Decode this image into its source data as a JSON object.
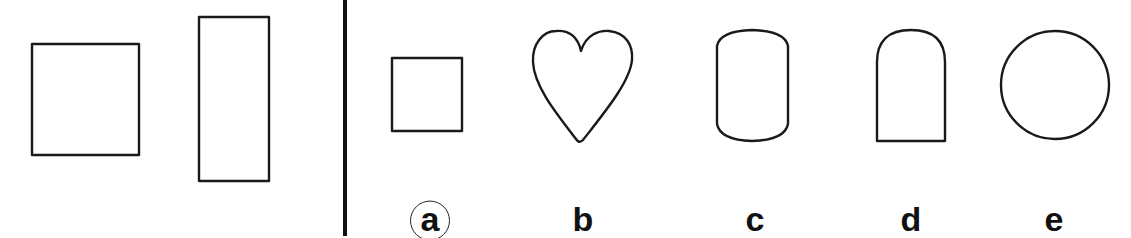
{
  "figure": {
    "type": "shape-analogy-puzzle",
    "stroke_color": "#1a1a1a",
    "background": "#ffffff",
    "divider_color": "#111111",
    "question_shapes": [
      {
        "id": "square",
        "shape": "square"
      },
      {
        "id": "tall-rectangle",
        "shape": "tall rectangle"
      }
    ],
    "options": [
      {
        "key": "a",
        "label": "a",
        "shape": "square",
        "selected": true
      },
      {
        "key": "b",
        "label": "b",
        "shape": "heart",
        "selected": false
      },
      {
        "key": "c",
        "label": "c",
        "shape": "barrel / rounded top and bottom rectangle",
        "selected": false
      },
      {
        "key": "d",
        "label": "d",
        "shape": "arch (rounded top, flat bottom)",
        "selected": false
      },
      {
        "key": "e",
        "label": "e",
        "shape": "circle",
        "selected": false
      }
    ]
  }
}
